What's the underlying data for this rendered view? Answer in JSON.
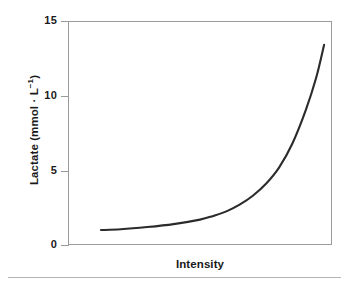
{
  "figure": {
    "background_color": "#ffffff",
    "frame_color": "#9a9a9a",
    "curve_color": "#2b2b2b",
    "text_color": "#1a1a1a",
    "rule_color": "#b4b4b4"
  },
  "chart_data": {
    "type": "line",
    "title": "",
    "subtitle": "",
    "xlabel": "Intensity",
    "ylabel": "Lactate (mmol · L⁻¹)",
    "ylabel_parts": {
      "base": "Lactate (mmol · L",
      "exponent": "−1",
      "tail": ")"
    },
    "grid": false,
    "legend": false,
    "legend_position": "none",
    "xlim": [
      0,
      100
    ],
    "ylim": [
      0,
      15
    ],
    "yticks": [
      0,
      5,
      10,
      15
    ],
    "ytick_labels": [
      "0",
      "5",
      "10",
      "15"
    ],
    "xticks": [],
    "xtick_labels": [],
    "series": [
      {
        "name": "Blood lactate response",
        "x": [
          12.5,
          20,
          30,
          40,
          50,
          55,
          60,
          65,
          70,
          75,
          80,
          85,
          90,
          94,
          97
        ],
        "y": [
          1.0,
          1.05,
          1.2,
          1.4,
          1.7,
          1.95,
          2.25,
          2.7,
          3.3,
          4.1,
          5.2,
          6.8,
          9.0,
          11.2,
          13.4
        ]
      }
    ],
    "annotations": []
  },
  "axis": {
    "y_ticks": [
      {
        "label": "15",
        "value": 15
      },
      {
        "label": "10",
        "value": 10
      },
      {
        "label": "5",
        "value": 5
      },
      {
        "label": "0",
        "value": 0
      }
    ]
  }
}
